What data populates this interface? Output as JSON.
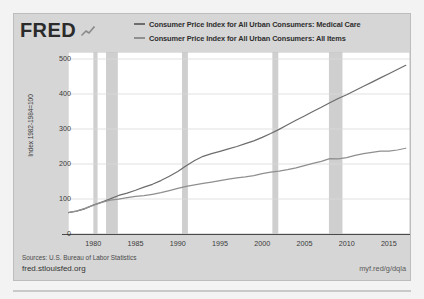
{
  "logo": {
    "text": "FRED",
    "mark": "line-chart-mark-icon"
  },
  "legend": {
    "position": "top-right",
    "entries": [
      {
        "label": "Consumer Price Index for All Urban Consumers: Medical Care",
        "color": "#6d6d6d"
      },
      {
        "label": "Consumer Price Index for All Urban Consumers: All Items",
        "color": "#8f8f8f"
      }
    ]
  },
  "footer": {
    "sources": "Sources: U.S. Bureau of Labor Statistics",
    "site": "fred.stlouisfed.org",
    "short_url": "myf.red/g/dqla"
  },
  "chart_data": {
    "type": "line",
    "title": "",
    "subtitle": "",
    "xlabel": "",
    "ylabel": "Index 1982-1984=100",
    "xlim": [
      1977,
      2017.5
    ],
    "ylim": [
      0,
      520
    ],
    "yticks": [
      0,
      100,
      200,
      300,
      400,
      500
    ],
    "xticks": [
      1980,
      1985,
      1990,
      1995,
      2000,
      2005,
      2010,
      2015
    ],
    "grid": true,
    "grid_axis": "y",
    "legend_position": "top-right",
    "plot_background": "#ffffff",
    "card_background": "#d6d6d6",
    "recession_color": "#cfcfcf",
    "recessions": [
      {
        "start": 1980.0,
        "end": 1980.5
      },
      {
        "start": 1981.5,
        "end": 1982.9
      },
      {
        "start": 1990.5,
        "end": 1991.2
      },
      {
        "start": 2001.2,
        "end": 2001.9
      },
      {
        "start": 2007.9,
        "end": 2009.5
      }
    ],
    "x": [
      1977,
      1978,
      1979,
      1980,
      1981,
      1982,
      1983,
      1984,
      1985,
      1986,
      1987,
      1988,
      1989,
      1990,
      1991,
      1992,
      1993,
      1994,
      1995,
      1996,
      1997,
      1998,
      1999,
      2000,
      2001,
      2002,
      2003,
      2004,
      2005,
      2006,
      2007,
      2008,
      2009,
      2010,
      2011,
      2012,
      2013,
      2014,
      2015,
      2016,
      2017
    ],
    "series": [
      {
        "name": "Consumer Price Index for All Urban Consumers: Medical Care",
        "color": "#6d6d6d",
        "values": [
          61.0,
          65.5,
          72.0,
          82.3,
          91.0,
          100.2,
          110.1,
          116.9,
          125.0,
          133.8,
          142.0,
          152.7,
          165.0,
          178.8,
          195.0,
          210.0,
          222.0,
          229.5,
          236.0,
          243.0,
          250.0,
          258.0,
          266.0,
          276.0,
          287.0,
          299.0,
          312.0,
          325.0,
          337.0,
          350.0,
          362.0,
          375.0,
          387.0,
          398.0,
          410.0,
          422.0,
          434.0,
          446.0,
          458.0,
          470.0,
          482.0
        ]
      },
      {
        "name": "Consumer Price Index for All Urban Consumers: All Items",
        "color": "#8f8f8f",
        "values": [
          61.0,
          65.5,
          73.0,
          82.5,
          90.5,
          96.5,
          99.5,
          103.8,
          107.5,
          109.5,
          113.5,
          118.0,
          124.0,
          130.5,
          136.0,
          140.2,
          144.4,
          148.2,
          152.3,
          156.8,
          160.5,
          163.0,
          166.5,
          172.2,
          177.1,
          179.9,
          184.0,
          188.9,
          195.3,
          201.6,
          207.3,
          215.3,
          214.5,
          218.1,
          224.9,
          229.6,
          233.0,
          236.7,
          237.0,
          240.0,
          245.0
        ]
      }
    ]
  }
}
